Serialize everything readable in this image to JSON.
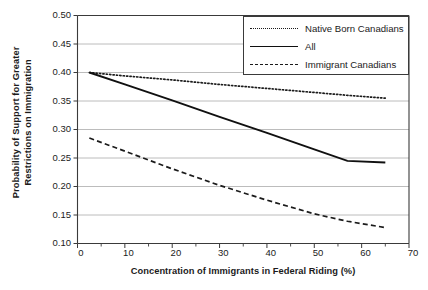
{
  "chart_data": {
    "type": "line",
    "title": "",
    "xlabel": "Concentration of Immigrants in Federal Riding (%)",
    "ylabel": "Probability of Support for Greater\nRestrictions on Immigration",
    "xlim": [
      0,
      70
    ],
    "ylim": [
      0.1,
      0.5
    ],
    "xticks": [
      0,
      10,
      20,
      30,
      40,
      50,
      60,
      70
    ],
    "xtick_labels": [
      "0",
      "10",
      "20",
      "30",
      "40",
      "50",
      "60",
      "70"
    ],
    "xminor_ticks": [
      5,
      15,
      25,
      35,
      45,
      55,
      65
    ],
    "yticks": [
      0.1,
      0.15,
      0.2,
      0.25,
      0.3,
      0.35,
      0.4,
      0.45,
      0.5
    ],
    "ytick_labels": [
      "0.10",
      "0.15",
      "0.20",
      "0.25",
      "0.30",
      "0.35",
      "0.40",
      "0.45",
      "0.50"
    ],
    "grid": "horizontal",
    "legend_position": "top-right",
    "series": [
      {
        "name": "Native Born Canadians",
        "style": "dotted",
        "color": "#1b1b1b",
        "x": [
          2.5,
          10,
          20,
          30,
          40,
          50,
          57,
          65
        ],
        "values": [
          0.4,
          0.394,
          0.387,
          0.379,
          0.372,
          0.365,
          0.36,
          0.355
        ]
      },
      {
        "name": "All",
        "style": "solid",
        "color": "#101010",
        "x": [
          2.5,
          10,
          20,
          30,
          40,
          50,
          57,
          65
        ],
        "values": [
          0.4,
          0.379,
          0.351,
          0.322,
          0.294,
          0.265,
          0.245,
          0.242
        ]
      },
      {
        "name": "Immigrant Canadians",
        "style": "dashed",
        "color": "#1b1b1b",
        "x": [
          2.5,
          10,
          20,
          30,
          40,
          50,
          57,
          65
        ],
        "values": [
          0.285,
          0.262,
          0.231,
          0.202,
          0.176,
          0.152,
          0.139,
          0.128
        ]
      }
    ]
  },
  "legend": {
    "items": [
      {
        "label": "Native Born Canadians",
        "key": "dotted-line-key"
      },
      {
        "label": "All",
        "key": "solid-line-key"
      },
      {
        "label": "Immigrant Canadians",
        "key": "dashed-line-key"
      }
    ]
  },
  "axes": {
    "y_title": "Probability of Support for Greater\nRestrictions on Immigration",
    "x_title": "Concentration of Immigrants in Federal Riding (%)",
    "y_labels": [
      "0.50",
      "0.45",
      "0.40",
      "0.35",
      "0.30",
      "0.25",
      "0.20",
      "0.15",
      "0.10"
    ],
    "x_labels": [
      "0",
      "10",
      "20",
      "30",
      "40",
      "50",
      "60",
      "70"
    ]
  }
}
